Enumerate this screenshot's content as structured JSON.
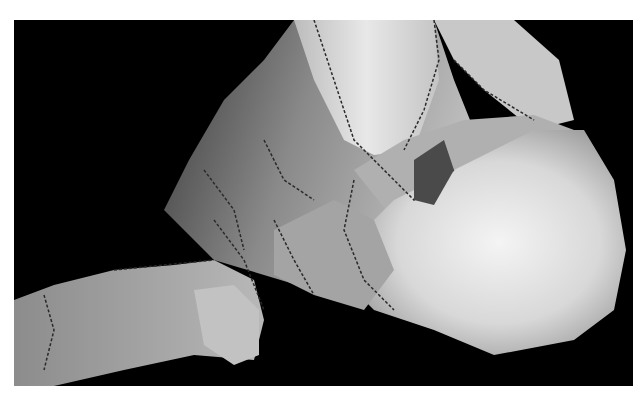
{
  "image": {
    "subject": "3D surface rendering of foot bones (calcaneus, talus, midfoot) in grayscale",
    "background_color": "#000000",
    "border_color": "#ffffff"
  }
}
